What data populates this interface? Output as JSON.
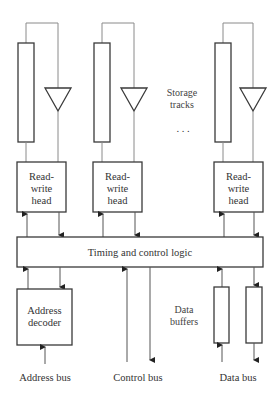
{
  "diagram": {
    "title": "",
    "storage_label_line1": "Storage",
    "storage_label_line2": "tracks",
    "ellipsis": ". . .",
    "heads": [
      {
        "line1": "Read-",
        "line2": "write",
        "line3": "head"
      },
      {
        "line1": "Read-",
        "line2": "write",
        "line3": "head"
      },
      {
        "line1": "Read-",
        "line2": "write",
        "line3": "head"
      }
    ],
    "timing_label": "Timing and control logic",
    "address_decoder_line1": "Address",
    "address_decoder_line2": "decoder",
    "data_buffers_line1": "Data",
    "data_buffers_line2": "buffers",
    "bus_labels": {
      "address": "Address bus",
      "control": "Control bus",
      "data": "Data bus"
    },
    "colors": {
      "stroke": "#3a3a3a",
      "wire": "#8a8a8a",
      "text": "#333333",
      "background": "#ffffff"
    }
  }
}
